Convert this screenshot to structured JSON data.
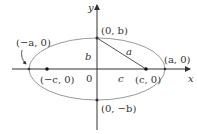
{
  "diagram": {
    "type": "ellipse-foci",
    "axes": {
      "x_label": "x",
      "y_label": "y",
      "origin_label": "0"
    },
    "labels": {
      "neg_a": "(−a, 0)",
      "pos_a": "(a, 0)",
      "neg_c": "(−c, 0)",
      "pos_c": "(c, 0)",
      "pos_b": "(0, b)",
      "neg_b": "(0, −b)",
      "seg_b": "b",
      "seg_c": "c",
      "seg_a": "a"
    },
    "colors": {
      "ellipse": "#9a9a9a",
      "axes": "#333333",
      "points": "#111111"
    }
  }
}
